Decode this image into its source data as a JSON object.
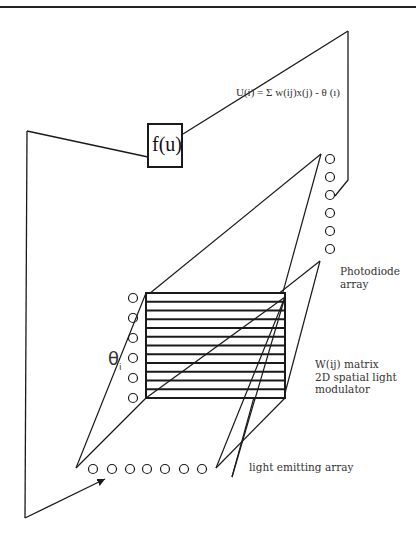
{
  "figure": {
    "equation_label": "U(i) = Σ w(ij)x(j) -  θ (ı)",
    "activation_box_label": "f(u)",
    "photodiode_label": "Photodiode\narray",
    "matrix_label": "W(ij) matrix\n2D spatial light\nmodulator",
    "emitter_label": "light emitting array",
    "threshold_label": "θ",
    "threshold_subscript": "i"
  },
  "components": {
    "photodiode_array_count": 6,
    "threshold_source_count": 6,
    "light_emitting_array_count": 7,
    "matrix_row_bands": 12
  },
  "colors": {
    "line": "#1a1a1a",
    "background": "#ffffff",
    "text": "#333333"
  }
}
